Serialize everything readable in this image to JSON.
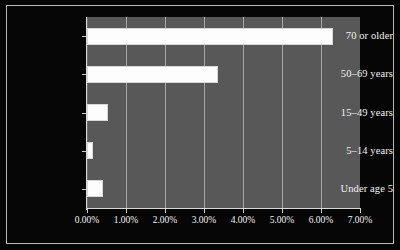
{
  "chart_data": {
    "type": "bar",
    "orientation": "horizontal",
    "title": "",
    "subtitle": "",
    "xlabel": "",
    "ylabel": "",
    "categories": [
      "Under age 5",
      "5–14 years",
      "15–49 years",
      "50–69 years",
      "70 or older"
    ],
    "values": [
      0.42,
      0.15,
      0.55,
      3.35,
      6.3
    ],
    "xlim": [
      0,
      7
    ],
    "ylim": null,
    "x_tick_values": [
      0,
      1,
      2,
      3,
      4,
      5,
      6,
      7
    ],
    "x_tick_labels": [
      "0.00%",
      "1.00%",
      "2.00%",
      "3.00%",
      "4.00%",
      "5.00%",
      "6.00%",
      "7.00%"
    ],
    "grid": true,
    "grid_axis": "x",
    "legend": false,
    "legend_position": "none",
    "annotations": [],
    "value_unit": "percent"
  },
  "style": {
    "figure_background": "#050505",
    "plot_background": "#585858",
    "bar_fill": "#fdfdfd",
    "bar_edge": "#d8d8d8",
    "gridline_color": "#a7a7a7",
    "axis_color": "#d9d9d9",
    "text_color": "#f2f2f2",
    "frame_border_color": "#b9b9b9"
  }
}
